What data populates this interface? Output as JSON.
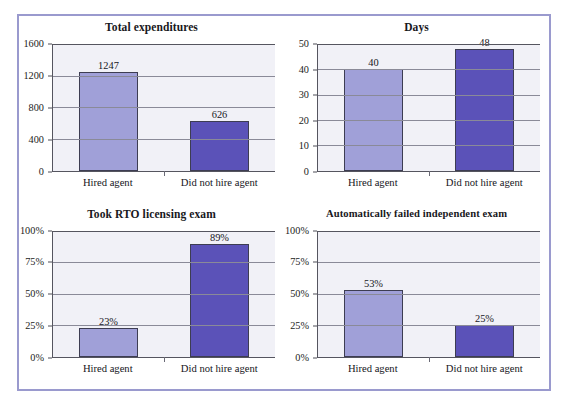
{
  "figure": {
    "border_color": "#9a9ace",
    "background": "#ffffff",
    "series_colors": {
      "hired_agent": "#a0a0d8",
      "did_not_hire_agent": "#5b52b8"
    }
  },
  "chart_data": [
    {
      "type": "bar",
      "title": "Total expenditures",
      "xlabel": "",
      "ylabel": "",
      "categories": [
        "Hired agent",
        "Did not hire agent"
      ],
      "values": [
        1247,
        626
      ],
      "value_labels": [
        "1247",
        "626"
      ],
      "ylim": [
        0,
        1600
      ],
      "yticks": [
        0,
        400,
        800,
        1200,
        1600
      ],
      "ytick_labels": [
        "0",
        "400",
        "800",
        "1200",
        "1600"
      ],
      "grid": true,
      "legend": "none",
      "bar_colors": [
        "#a0a0d8",
        "#5b52b8"
      ]
    },
    {
      "type": "bar",
      "title": "Days",
      "xlabel": "",
      "ylabel": "",
      "categories": [
        "Hired agent",
        "Did not hire agent"
      ],
      "values": [
        40,
        48
      ],
      "value_labels": [
        "40",
        "48"
      ],
      "ylim": [
        0,
        50
      ],
      "yticks": [
        0,
        10,
        20,
        30,
        40,
        50
      ],
      "ytick_labels": [
        "0",
        "10",
        "20",
        "30",
        "40",
        "50"
      ],
      "grid": true,
      "legend": "none",
      "bar_colors": [
        "#a0a0d8",
        "#5b52b8"
      ]
    },
    {
      "type": "bar",
      "title": "Took RTO licensing exam",
      "xlabel": "",
      "ylabel": "",
      "categories": [
        "Hired agent",
        "Did not hire agent"
      ],
      "values": [
        23,
        89
      ],
      "value_labels": [
        "23%",
        "89%"
      ],
      "ylim": [
        0,
        100
      ],
      "yticks": [
        0,
        25,
        50,
        75,
        100
      ],
      "ytick_labels": [
        "0%",
        "25%",
        "50%",
        "75%",
        "100%"
      ],
      "grid": true,
      "legend": "none",
      "bar_colors": [
        "#a0a0d8",
        "#5b52b8"
      ]
    },
    {
      "type": "bar",
      "title": "Automatically failed independent exam",
      "xlabel": "",
      "ylabel": "",
      "categories": [
        "Hired agent",
        "Did not hire agent"
      ],
      "values": [
        53,
        25
      ],
      "value_labels": [
        "53%",
        "25%"
      ],
      "ylim": [
        0,
        100
      ],
      "yticks": [
        0,
        25,
        50,
        75,
        100
      ],
      "ytick_labels": [
        "0%",
        "25%",
        "50%",
        "75%",
        "100%"
      ],
      "grid": true,
      "legend": "none",
      "bar_colors": [
        "#a0a0d8",
        "#5b52b8"
      ]
    }
  ]
}
